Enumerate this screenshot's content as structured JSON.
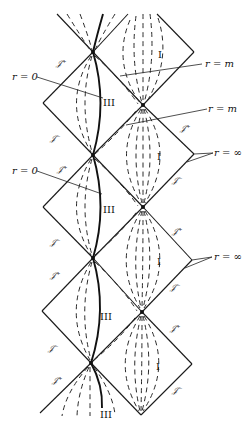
{
  "diagram": {
    "colors": {
      "line": "#1a1a1a",
      "background": "#ffffff"
    },
    "region_labels": [
      {
        "text": "I",
        "x": 158,
        "y": 56
      },
      {
        "text": "III",
        "x": 103,
        "y": 104
      },
      {
        "text": "I",
        "x": 157,
        "y": 158
      },
      {
        "text": "III",
        "x": 103,
        "y": 211
      },
      {
        "text": "I",
        "x": 157,
        "y": 263
      },
      {
        "text": "III",
        "x": 100,
        "y": 318
      },
      {
        "text": "I",
        "x": 156,
        "y": 368
      },
      {
        "text": "III",
        "x": 100,
        "y": 416
      }
    ],
    "scri_labels": [
      {
        "text": "𝒥⁺",
        "x": 56,
        "y": 66
      },
      {
        "text": "𝒥⁺",
        "x": 180,
        "y": 131
      },
      {
        "text": "𝒥⁻",
        "x": 50,
        "y": 141
      },
      {
        "text": "𝒥⁺",
        "x": 57,
        "y": 172
      },
      {
        "text": "𝒥⁻",
        "x": 172,
        "y": 183
      },
      {
        "text": "𝒥⁻",
        "x": 50,
        "y": 245
      },
      {
        "text": "𝒥⁺",
        "x": 172,
        "y": 234
      },
      {
        "text": "𝒥⁺",
        "x": 50,
        "y": 278
      },
      {
        "text": "𝒥⁻",
        "x": 170,
        "y": 290
      },
      {
        "text": "𝒥⁻",
        "x": 48,
        "y": 351
      },
      {
        "text": "𝒥⁺",
        "x": 170,
        "y": 331
      },
      {
        "text": "𝒥⁺",
        "x": 52,
        "y": 383
      },
      {
        "text": "𝒥⁻",
        "x": 172,
        "y": 393
      }
    ],
    "annotations": [
      {
        "text": "r = m",
        "x": 205,
        "y": 67,
        "line": [
          120,
          76,
          202,
          64
        ]
      },
      {
        "text": "r = 0",
        "x": 12,
        "y": 79,
        "line": [
          37,
          77,
          103,
          98
        ]
      },
      {
        "text": "r = m",
        "x": 207,
        "y": 112,
        "line": [
          126,
          125,
          207,
          109
        ]
      },
      {
        "text": "r = 0",
        "x": 12,
        "y": 174,
        "line": [
          37,
          171,
          102,
          194
        ]
      },
      {
        "text": "r = ∞",
        "x": 214,
        "y": 156,
        "line": [
          194,
          154,
          213,
          153
        ],
        "line2": [
          194,
          154,
          206,
          163
        ]
      },
      {
        "text": "r = ∞",
        "x": 214,
        "y": 260,
        "line": [
          192,
          260,
          212,
          257
        ],
        "line2": [
          192,
          260,
          206,
          268
        ]
      }
    ]
  }
}
